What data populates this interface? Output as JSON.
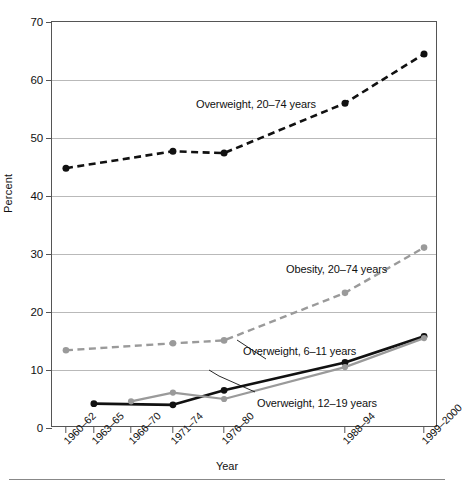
{
  "chart_data": {
    "type": "line",
    "title": "",
    "xlabel": "Year",
    "ylabel": "Percent",
    "ylim": [
      0,
      70
    ],
    "yticks": [
      0,
      10,
      20,
      30,
      40,
      50,
      60,
      70
    ],
    "grid": "horizontal",
    "legend": "inline-annotations",
    "categories": [
      "1960–62",
      "1963–65",
      "1966–70",
      "1971–74",
      "1976–80",
      "1988–94",
      "1999–2000"
    ],
    "x_positions": [
      1961,
      1964,
      1968,
      1972.5,
      1978,
      1991,
      1999.5
    ],
    "xlim": [
      1959.5,
      2001
    ],
    "series": [
      {
        "name": "Overweight, 20–74 years",
        "style": "dashed-black",
        "color": "#111111",
        "x": [
          1961,
          1972.5,
          1978,
          1991,
          1999.5
        ],
        "values": [
          44.8,
          47.7,
          47.4,
          56.0,
          64.5
        ]
      },
      {
        "name": "Obesity, 20–74 years",
        "style": "dashed-gray",
        "color": "#9a9a9a",
        "x": [
          1961,
          1972.5,
          1978,
          1991,
          1999.5
        ],
        "values": [
          13.4,
          14.6,
          15.1,
          23.3,
          31.1
        ]
      },
      {
        "name": "Overweight, 6–11 years",
        "style": "solid-black",
        "color": "#111111",
        "x": [
          1964,
          1972.5,
          1978,
          1991,
          1999.5
        ],
        "values": [
          4.2,
          4.0,
          6.5,
          11.3,
          15.8
        ]
      },
      {
        "name": "Overweight, 12–19 years",
        "style": "solid-gray",
        "color": "#9a9a9a",
        "x": [
          1968,
          1972.5,
          1978,
          1991,
          1999.5
        ],
        "values": [
          4.6,
          6.1,
          5.0,
          10.5,
          15.5
        ]
      }
    ],
    "annotations": [
      {
        "text": "Overweight, 20–74 years",
        "x_px": 196,
        "y_px": 98
      },
      {
        "text": "Obesity, 20–74 years",
        "x_px": 286,
        "y_px": 263
      },
      {
        "text": "Overweight, 6–11 years",
        "x_px": 243,
        "y_px": 345
      },
      {
        "text": "Overweight, 12–19 years",
        "x_px": 257,
        "y_px": 397
      }
    ]
  },
  "axes": {
    "y_title": "Percent",
    "x_title": "Year",
    "y_tick_labels": [
      "0",
      "10",
      "20",
      "30",
      "40",
      "50",
      "60",
      "70"
    ],
    "x_tick_labels": [
      "1960–62",
      "1963–65",
      "1966–70",
      "1971–74",
      "1976–80",
      "1988–94",
      "1999–2000"
    ]
  },
  "colors": {
    "black_series": "#111111",
    "gray_series": "#9a9a9a",
    "gridline": "#b9b9b9",
    "axis": "#555555",
    "background": "#ffffff"
  }
}
